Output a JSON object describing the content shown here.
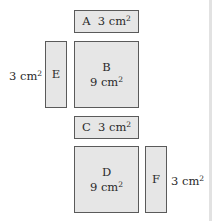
{
  "diagram": {
    "title": "",
    "unit": "cm",
    "unit_exponent": "2",
    "shapes": [
      {
        "id": "A",
        "letter": "A",
        "area": "3",
        "shape": "rectangle"
      },
      {
        "id": "B",
        "letter": "B",
        "area": "9",
        "shape": "square"
      },
      {
        "id": "C",
        "letter": "C",
        "area": "3",
        "shape": "rectangle"
      },
      {
        "id": "D",
        "letter": "D",
        "area": "9",
        "shape": "square"
      },
      {
        "id": "E",
        "letter": "E",
        "area": "3",
        "shape": "rectangle",
        "area_label_position": "left"
      },
      {
        "id": "F",
        "letter": "F",
        "area": "3",
        "shape": "rectangle",
        "area_label_position": "right"
      }
    ]
  },
  "colors": {
    "fill": "#e6e6e6",
    "stroke": "#5a5a5a",
    "text": "#2a2a2a"
  }
}
